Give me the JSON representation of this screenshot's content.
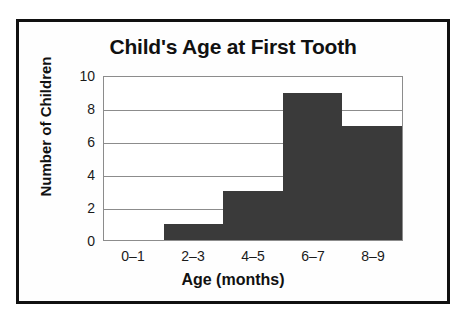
{
  "chart_data": {
    "type": "bar",
    "title": "Child's Age at First Tooth",
    "xlabel": "Age (months)",
    "ylabel": "Number of Children",
    "categories": [
      "0–1",
      "2–3",
      "4–5",
      "6–7",
      "8–9"
    ],
    "values": [
      0,
      1,
      3,
      9,
      7
    ],
    "ylim": [
      0,
      10
    ],
    "yticks": [
      0,
      2,
      4,
      6,
      8,
      10
    ],
    "ytick_labels": [
      "0",
      "2",
      "4",
      "6",
      "8",
      "10"
    ],
    "grid": true,
    "grid_axis": "y",
    "legend": false,
    "bar_color": "#3a3a3a",
    "grid_color": "#8c8c8c",
    "frame_color": "#111111",
    "background_color": "#ffffff"
  }
}
